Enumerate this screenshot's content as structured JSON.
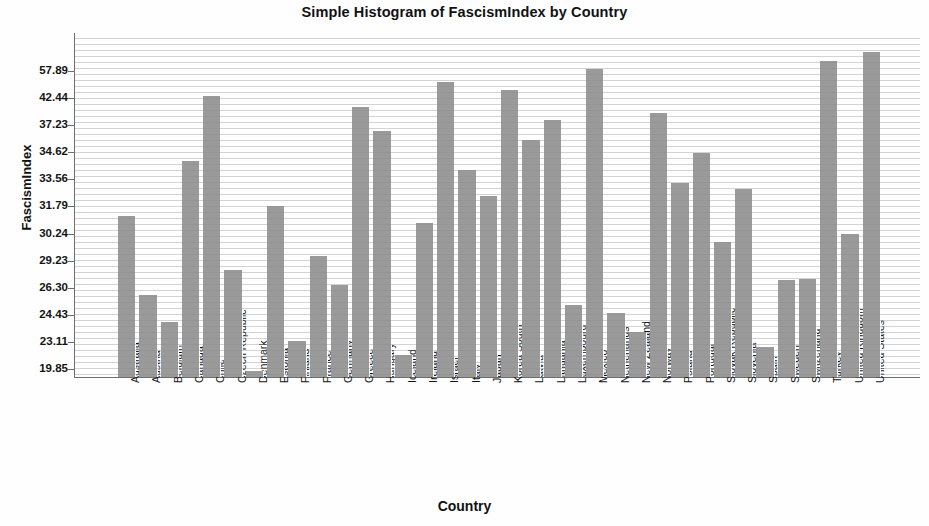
{
  "chart_data": {
    "type": "bar",
    "title": "Simple Histogram of FascismIndex by Country",
    "xlabel": "Country",
    "ylabel": "FascismIndex",
    "grid": true,
    "legend": null,
    "y_axis_type": "ordinal",
    "y_tick_labels": [
      "57.89",
      "42.44",
      "37.23",
      "34.62",
      "33.56",
      "31.79",
      "30.24",
      "29.23",
      "26.30",
      "24.43",
      "23.11",
      "19.85"
    ],
    "bar_color": "#9a9a9a",
    "categories": [
      "Australia",
      "Austria",
      "Belgium",
      "Canada",
      "Chile",
      "Czech Republic",
      "Denmark",
      "Estonia",
      "Finland",
      "France",
      "Germany",
      "Greece",
      "Hungary",
      "Iceland",
      "Ireland",
      "Israel",
      "Italy",
      "Japan",
      "Korea South",
      "Latvia",
      "Lithuania",
      "Luxembourg",
      "Mexico",
      "Netherlands",
      "New Zealand",
      "Norway",
      "Poland",
      "Portugal",
      "Slovak Republic",
      "Slovenia",
      "Spain",
      "Sweden",
      "Switzerland",
      "Turkey",
      "United Kingdom",
      "United States"
    ],
    "values": [
      31.1,
      25.7,
      24.1,
      34.2,
      43.2,
      28.6,
      20.1,
      31.9,
      23.3,
      29.3,
      26.6,
      41.2,
      36.4,
      21.9,
      30.9,
      53.6,
      35.3,
      32.5,
      46.2,
      35.9,
      37.6,
      25.1,
      57.89,
      24.7,
      23.5,
      39.3,
      33.7,
      34.9,
      30.0,
      33.1,
      22.3,
      27.1,
      58.2,
      30.3,
      60.5,
      60.5
    ],
    "bar_tops_px": [
      215.7,
      295.0,
      321.7,
      161.0,
      95.7,
      270.0,
      371.0,
      206.0,
      341.0,
      256.0,
      285.0,
      107.0,
      131.0,
      355.0,
      223.0,
      82.0,
      170.0,
      196.0,
      90.0,
      140.0,
      120.0,
      305.0,
      69.0,
      313.0,
      332.0,
      113.0,
      183.0,
      153.0,
      242.0,
      189.0,
      347.0,
      280.0,
      279.3,
      61.0,
      234.3,
      52.3
    ]
  }
}
